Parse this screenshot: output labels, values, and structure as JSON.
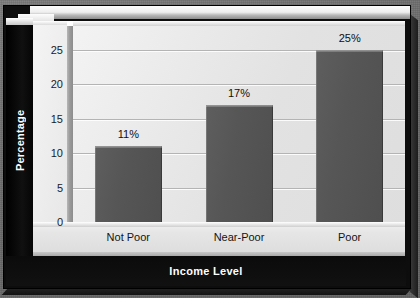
{
  "chart_data": {
    "type": "bar",
    "title": "",
    "xlabel": "Income Level",
    "ylabel": "Percentage",
    "categories": [
      "Not Poor",
      "Near-Poor",
      "Poor"
    ],
    "values": [
      11,
      17,
      25
    ],
    "data_labels": [
      "11%",
      "17%",
      "25%"
    ],
    "ylim": [
      0,
      25
    ],
    "y_ticks": [
      "0",
      "5",
      "10",
      "15",
      "20",
      "25"
    ],
    "y_tick_values": [
      0,
      5,
      10,
      15,
      20,
      25
    ],
    "grid": true,
    "legend": "none",
    "style": "3d-bar",
    "colors": {
      "bar": "#565656",
      "plot_background": "#e6e6e6",
      "frame": "#0d0d0d",
      "outer_background": "#6e6e6e",
      "gridline": "#b4b4b4",
      "axis_title_text": "#ffffff",
      "tick_text": "#1a1a1a"
    }
  }
}
